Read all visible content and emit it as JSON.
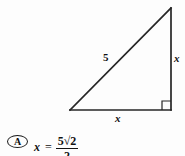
{
  "figure": {
    "type": "right-triangle-diagram",
    "stroke_color": "#262626",
    "background_color": "#fdfdfd",
    "vertices": {
      "bottom_left": [
        70,
        110
      ],
      "bottom_right": [
        171,
        110
      ],
      "top_right": [
        171,
        8
      ]
    },
    "right_angle_marker": {
      "at_vertex": "bottom_right",
      "size": 9
    },
    "labels": {
      "hypotenuse": "5",
      "vertical_leg": "x",
      "horizontal_leg": "x"
    }
  },
  "answer_choice": {
    "bullet": "A",
    "variable": "x",
    "equals": "=",
    "value_numerator": "5√2",
    "value_denominator": "2",
    "value_plain": "x = 5√2/2"
  }
}
